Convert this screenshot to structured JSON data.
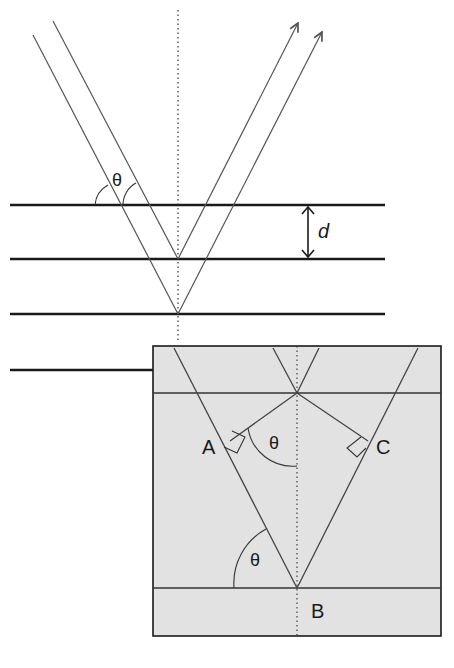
{
  "figure": {
    "labels": {
      "theta_top": "θ",
      "spacing": "d",
      "point_a": "A",
      "point_b": "B",
      "point_c": "C",
      "theta_inset_upper": "θ",
      "theta_inset_lower": "θ"
    },
    "colors": {
      "line": "#1a1a1a",
      "ray": "#555555",
      "inset_fill": "#e2e2e2",
      "background": "#ffffff"
    }
  }
}
